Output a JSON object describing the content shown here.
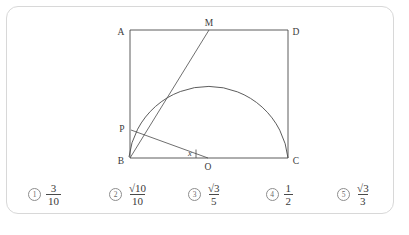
{
  "card": {
    "background": "#ffffff",
    "border_color": "#d8d8d8"
  },
  "figure": {
    "stroke_color": "#4a4a4a",
    "vertex_labels": {
      "A": "A",
      "D": "D",
      "B": "B",
      "C": "C",
      "M": "M",
      "P": "P",
      "O": "O"
    },
    "angle_label": "x"
  },
  "choices": [
    {
      "marker": "1",
      "numerator": "3",
      "denominator": "10",
      "value": "3/10"
    },
    {
      "marker": "2",
      "numerator": "√10",
      "denominator": "10",
      "value": "sqrt(10)/10"
    },
    {
      "marker": "3",
      "numerator": "√3",
      "denominator": "5",
      "value": "sqrt(3)/5"
    },
    {
      "marker": "4",
      "numerator": "1",
      "denominator": "2",
      "value": "1/2"
    },
    {
      "marker": "5",
      "numerator": "√3",
      "denominator": "3",
      "value": "sqrt(3)/3"
    }
  ]
}
